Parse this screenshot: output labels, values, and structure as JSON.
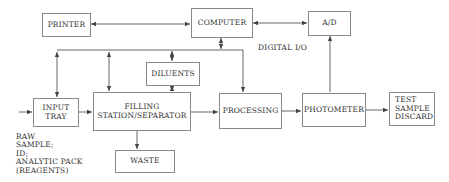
{
  "diagram": {
    "blocks": {
      "printer": "PRINTER",
      "computer": "COMPUTER",
      "ad": "A/D",
      "diluents": "DILUENTS",
      "input_tray": "INPUT\nTRAY",
      "filling": "FILLING\nSTATION/SEPARATOR",
      "processing": "PROCESSING",
      "photometer": "PHOTOMETER",
      "discard": "TEST\nSAMPLE\nDISCARD",
      "waste": "WASTE"
    },
    "labels": {
      "digital_io": "DIGITAL I/O",
      "raw_sample": "RAW\nSAMPLE;\nID;\nANALYTIC PACK\n(REAGENTS)"
    },
    "colors": {
      "line": "#555555",
      "box_border": "#8a8a8a",
      "text": "#333333"
    }
  }
}
